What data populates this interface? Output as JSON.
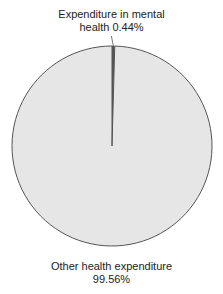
{
  "chart_data": {
    "type": "pie",
    "title": "",
    "categories": [
      "Expenditure in mental health",
      "Other health expenditure"
    ],
    "values": [
      0.44,
      99.56
    ],
    "units": "%",
    "labels": [
      {
        "line1": "Expenditure in mental",
        "line2": "health 0.44%"
      },
      {
        "line1": "Other health expenditure",
        "line2": "99.56%"
      }
    ],
    "colors": {
      "mental": "#555555",
      "other": "#e6e6e6",
      "outline": "#555555"
    },
    "legend": "none",
    "start_angle_deg": 90,
    "direction": "clockwise"
  }
}
